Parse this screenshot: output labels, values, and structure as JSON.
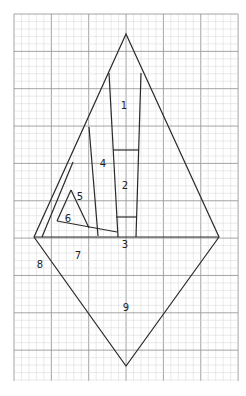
{
  "diagram": {
    "type": "foundation-paper-piecing-pattern",
    "grid": {
      "x0": 14,
      "y0": 14,
      "x1": 238,
      "y1": 381,
      "minor_step": 7.47,
      "major_every": 5,
      "minor_color": "#d4d4d4",
      "major_color": "#9a9a9a"
    },
    "outline_color": "#2a2a2a",
    "pieces": [
      {
        "id": "1",
        "label": "1",
        "lx": 124,
        "ly": 106
      },
      {
        "id": "2",
        "label": "2",
        "lx": 125,
        "ly": 186
      },
      {
        "id": "3",
        "label": "3",
        "lx": 125,
        "ly": 245
      },
      {
        "id": "4",
        "label": "4",
        "lx": 103,
        "ly": 164
      },
      {
        "id": "5",
        "label": "5",
        "lx": 80,
        "ly": 197
      },
      {
        "id": "6",
        "label": "6",
        "lx": 68,
        "ly": 219
      },
      {
        "id": "7",
        "label": "7",
        "lx": 78,
        "ly": 256
      },
      {
        "id": "8",
        "label": "8",
        "lx": 40,
        "ly": 265
      },
      {
        "id": "9",
        "label": "9",
        "lx": 126,
        "ly": 308
      }
    ]
  }
}
